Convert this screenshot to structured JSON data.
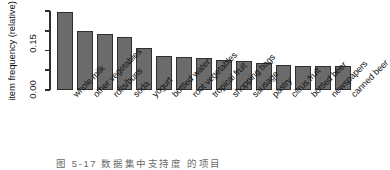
{
  "chart_data": {
    "type": "bar",
    "title": "",
    "xlabel": "",
    "ylabel": "item frequency (relative)",
    "ylim": [
      0.0,
      0.26
    ],
    "grid": false,
    "legend": null,
    "ytick_labels": [
      "0.00",
      "0.15"
    ],
    "ytick_values": [
      0.0,
      0.15
    ],
    "minor_tick_count": 5,
    "categories": [
      "whole milk",
      "other vegetables",
      "rolls/buns",
      "soda",
      "yogurt",
      "bottled water",
      "root vegetables",
      "tropical fruit",
      "shopping bags",
      "sausage",
      "pastry",
      "citrus fruit",
      "bottled beer",
      "newspapers",
      "canned beer"
    ],
    "values": [
      0.2555,
      0.1935,
      0.1839,
      0.1743,
      0.1395,
      0.1105,
      0.109,
      0.1049,
      0.0985,
      0.094,
      0.0889,
      0.0828,
      0.0805,
      0.0798,
      0.0777
    ],
    "bar_color": "#6b6b6b",
    "bar_border_color": "#2f2f2f",
    "axis_color": "#2e2e2e"
  },
  "caption": {
    "text": "图 5-17     数据集中支持度     的项目"
  }
}
